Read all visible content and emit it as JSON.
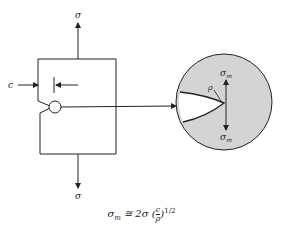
{
  "diagram": {
    "labels": {
      "applied_stress_top": "σ",
      "applied_stress_bottom": "σ",
      "crack_length": "c",
      "tip_radius": "ρ",
      "max_stress_top": "σ",
      "max_stress_top_sub": "m",
      "max_stress_bottom": "σ",
      "max_stress_bottom_sub": "m"
    },
    "equation": {
      "lhs": "σ",
      "lhs_sub": "m",
      "relation": " ≅ 2σ (",
      "frac_num": "c",
      "frac_den": "ρ",
      "close": ")",
      "exponent": "1/2"
    },
    "colors": {
      "line": "#222222",
      "magnified_fill": "#d4d4d4",
      "background": "#ffffff"
    }
  }
}
